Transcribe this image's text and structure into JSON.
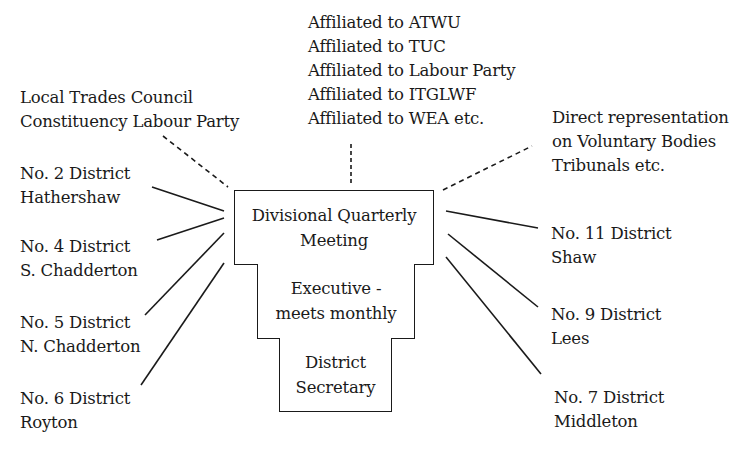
{
  "diagram": {
    "central": {
      "quarterly_meeting": [
        "Divisional Quarterly",
        "Meeting"
      ],
      "executive": [
        "Executive -",
        "meets monthly"
      ],
      "secretary": [
        "District",
        "Secretary"
      ]
    },
    "affiliations": [
      "Affiliated to ATWU",
      "Affiliated to TUC",
      "Affiliated to Labour Party",
      "Affiliated to ITGLWF",
      "Affiliated to WEA etc."
    ],
    "local_bodies": [
      "Local Trades Council",
      "Constituency Labour Party"
    ],
    "direct_representation": [
      "Direct representation",
      "on Voluntary Bodies",
      "Tribunals etc."
    ],
    "districts_left": [
      {
        "number": "No. 2 District",
        "name": "Hathershaw"
      },
      {
        "number": "No. 4 District",
        "name": "S. Chadderton"
      },
      {
        "number": "No. 5 District",
        "name": "N. Chadderton"
      },
      {
        "number": "No. 6 District",
        "name": "Royton"
      }
    ],
    "districts_right": [
      {
        "number": "No. 11 District",
        "name": "Shaw"
      },
      {
        "number": "No. 9 District",
        "name": "Lees"
      },
      {
        "number": "No. 7 District",
        "name": "Middleton"
      }
    ],
    "line_color": "#1a1a1a"
  }
}
